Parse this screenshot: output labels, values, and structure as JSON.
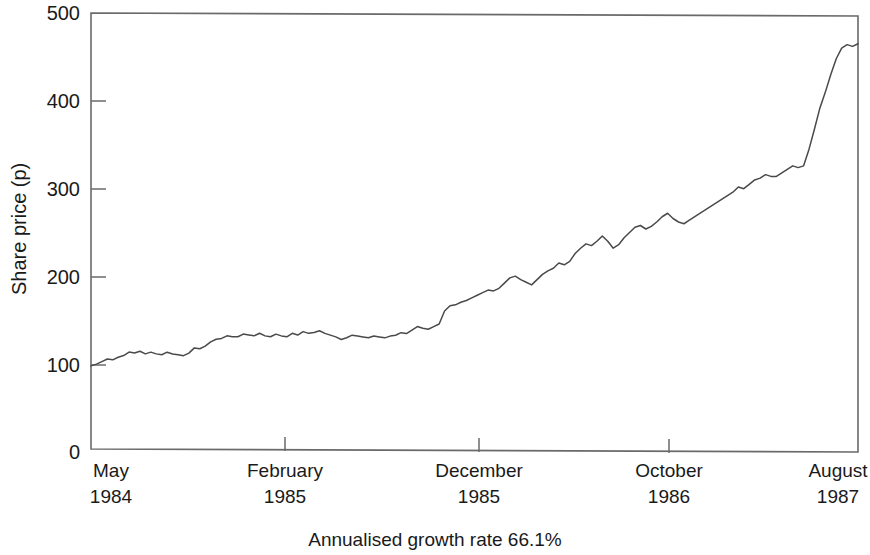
{
  "chart_data": {
    "type": "line",
    "title": "",
    "xlabel": "",
    "ylabel": "Share price (p)",
    "caption": "Annualised growth rate 66.1%",
    "grid": false,
    "legend": "none",
    "ylim": [
      0,
      500
    ],
    "yticks": [
      0,
      100,
      200,
      300,
      400,
      500
    ],
    "ytick_labels": [
      "0",
      "100",
      "200",
      "300",
      "400",
      "500"
    ],
    "xtick_labels": [
      {
        "month": "May",
        "year": "1984"
      },
      {
        "month": "February",
        "year": "1985"
      },
      {
        "month": "December",
        "year": "1985"
      },
      {
        "month": "October",
        "year": "1986"
      },
      {
        "month": "August",
        "year": "1987"
      }
    ],
    "xtick_positions": [
      0,
      0.253,
      0.506,
      0.754,
      1.0
    ],
    "series": [
      {
        "name": "Share price",
        "units": "p",
        "values": [
          96,
          98,
          101,
          104,
          103,
          106,
          108,
          112,
          111,
          113,
          110,
          112,
          110,
          109,
          112,
          110,
          109,
          108,
          111,
          117,
          116,
          119,
          124,
          127,
          128,
          131,
          130,
          130,
          133,
          132,
          131,
          134,
          131,
          130,
          133,
          131,
          130,
          134,
          132,
          136,
          134,
          135,
          137,
          134,
          132,
          130,
          127,
          129,
          132,
          131,
          130,
          129,
          131,
          130,
          129,
          131,
          132,
          135,
          134,
          138,
          142,
          140,
          139,
          142,
          145,
          160,
          166,
          167,
          170,
          172,
          175,
          178,
          181,
          184,
          183,
          186,
          192,
          198,
          200,
          196,
          193,
          190,
          196,
          202,
          206,
          209,
          215,
          213,
          217,
          226,
          232,
          237,
          235,
          240,
          246,
          240,
          232,
          236,
          244,
          250,
          256,
          258,
          254,
          257,
          262,
          268,
          272,
          266,
          262,
          260,
          264,
          268,
          272,
          276,
          280,
          284,
          288,
          292,
          296,
          302,
          300,
          305,
          310,
          312,
          316,
          314,
          314,
          318,
          322,
          326,
          324,
          326,
          345,
          368,
          392,
          410,
          430,
          448,
          460,
          464,
          462,
          465
        ]
      }
    ]
  },
  "plot_geometry": {
    "left": 91,
    "right": 858,
    "top": 13,
    "bottom": 452
  }
}
